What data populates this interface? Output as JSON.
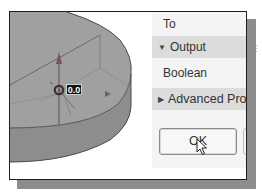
{
  "viewport": {
    "dimension_value": "0.0",
    "colors": {
      "solid_top": "#9d9d9d",
      "solid_side": "#8a8a8a",
      "edge": "#555555",
      "background": "#ffffff"
    }
  },
  "panel": {
    "to_label": "To",
    "output_section": {
      "label": "Output",
      "icon": "triangle-down-icon",
      "expanded": true
    },
    "boolean_label": "Boolean",
    "advanced_section": {
      "label": "Advanced Properties",
      "visible_text": "Advanced Pro",
      "icon": "triangle-right-icon",
      "expanded": false
    },
    "ok_button_label": "OK",
    "section_bg": "#dcdcdc",
    "panel_bg": "#f4f4f4"
  },
  "cursor": {
    "icon": "mouse-pointer-icon"
  }
}
